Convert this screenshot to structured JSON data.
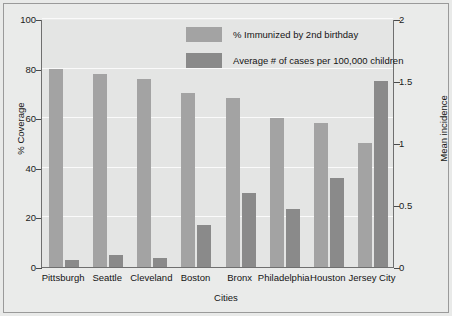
{
  "chart_data": {
    "type": "bar",
    "title": "",
    "xlabel": "Cities",
    "ylabel": "% Coverage",
    "y2label": "Mean incidence",
    "categories": [
      "Pittsburgh",
      "Seattle",
      "Cleveland",
      "Boston",
      "Bronx",
      "Philadelphia",
      "Houston",
      "Jersey City"
    ],
    "series": [
      {
        "name": "% Immunized by 2nd birthday",
        "axis": "left",
        "color": "#a3a3a3",
        "values": [
          80,
          78,
          76,
          70,
          68,
          60,
          58,
          50
        ]
      },
      {
        "name": "Average # of cases per 100,000 children",
        "axis": "right",
        "color": "#8a8a8a",
        "values": [
          0.06,
          0.1,
          0.07,
          0.34,
          0.6,
          0.47,
          0.72,
          1.5
        ]
      }
    ],
    "ylim": [
      0,
      100
    ],
    "y2lim": [
      0,
      2
    ],
    "yticks": [
      "0",
      "20",
      "40",
      "60",
      "80",
      "100"
    ],
    "ytick_values": [
      0,
      20,
      40,
      60,
      80,
      100
    ],
    "y2ticks": [
      "0",
      "0.5",
      "1",
      "1.5",
      "2"
    ],
    "y2tick_values": [
      0,
      0.5,
      1,
      1.5,
      2
    ],
    "grid": true,
    "legend_position": "top-center",
    "plot_background": "#e4e5e4",
    "figure_background": "#eaebea"
  },
  "legend": {
    "entries": [
      {
        "label": "% Immunized by 2nd birthday",
        "swatch": "light"
      },
      {
        "label": "Average # of cases per 100,000 children",
        "swatch": "dark"
      }
    ]
  }
}
